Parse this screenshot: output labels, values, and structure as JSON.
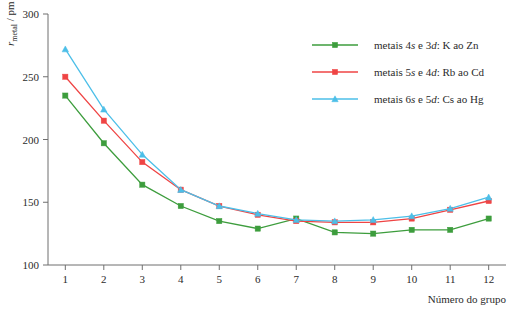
{
  "chart_data": {
    "type": "line",
    "title": "",
    "xlabel": "Número do grupo",
    "ylabel": "r_metal / pm",
    "ylabel_parts": {
      "main": "r",
      "sub": "metal",
      "unit": "/ pm"
    },
    "categories": [
      1,
      2,
      3,
      4,
      5,
      6,
      7,
      8,
      9,
      10,
      11,
      12
    ],
    "xlim": [
      0.55,
      12.45
    ],
    "ylim": [
      100,
      300
    ],
    "yticks": [
      100,
      150,
      200,
      250,
      300
    ],
    "xticks": [
      1,
      2,
      3,
      4,
      5,
      6,
      7,
      8,
      9,
      10,
      11,
      12
    ],
    "grid": false,
    "legend_position": "top-right",
    "series": [
      {
        "name": "metais 4s e 3d: K ao Zn",
        "name_prefix": "metais 4",
        "name_orb1": "s",
        "name_mid": " e 3",
        "name_orb2": "d",
        "name_suffix": ": K ao Zn",
        "color": "#3d9d3d",
        "marker": "square",
        "values": [
          235,
          197,
          164,
          147,
          135,
          129,
          137,
          126,
          125,
          128,
          128,
          137
        ]
      },
      {
        "name": "metais 5s e 4d: Rb ao Cd",
        "name_prefix": "metais 5",
        "name_orb1": "s",
        "name_mid": " e 4",
        "name_orb2": "d",
        "name_suffix": ": Rb ao Cd",
        "color": "#ef4444",
        "marker": "square",
        "values": [
          250,
          215,
          182,
          160,
          147,
          140,
          135,
          134,
          134,
          137,
          144,
          151
        ]
      },
      {
        "name": "metais 6s e 5d: Cs ao Hg",
        "name_prefix": "metais 6",
        "name_orb1": "s",
        "name_mid": " e 5",
        "name_orb2": "d",
        "name_suffix": ": Cs ao Hg",
        "color": "#4cbfe8",
        "marker": "triangle",
        "values": [
          272,
          224,
          188,
          160,
          147,
          141,
          136,
          135,
          136,
          139,
          145,
          154
        ]
      }
    ]
  },
  "axes": {
    "y_tick_labels": [
      "300",
      "250",
      "200",
      "150",
      "100"
    ],
    "x_tick_labels": [
      "1",
      "2",
      "3",
      "4",
      "5",
      "6",
      "7",
      "8",
      "9",
      "10",
      "11",
      "12"
    ],
    "x_axis_title": "Número do grupo"
  },
  "colors": {
    "series_green": "#3d9d3d",
    "series_red": "#ef4444",
    "series_blue": "#4cbfe8",
    "axis": "#6f6f6f",
    "text": "#2b2b2b",
    "background": "#ffffff"
  }
}
